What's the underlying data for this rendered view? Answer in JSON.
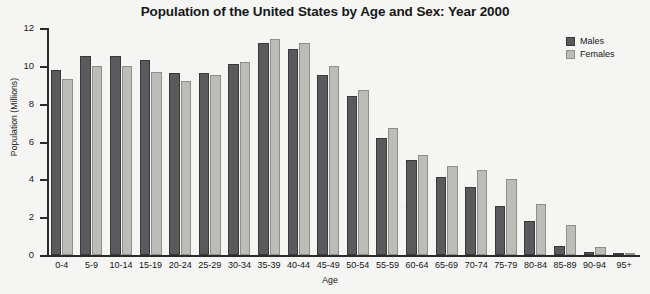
{
  "chart_data": {
    "type": "bar",
    "title": "Population of the United States by Age and Sex: Year 2000",
    "xlabel": "Age",
    "ylabel": "Population (Millions)",
    "ylim": [
      0,
      12
    ],
    "yticks": [
      0,
      2,
      4,
      6,
      8,
      10,
      12
    ],
    "grid": false,
    "legend_position": "top-right",
    "categories": [
      "0-4",
      "5-9",
      "10-14",
      "15-19",
      "20-24",
      "25-29",
      "30-34",
      "35-39",
      "40-44",
      "45-49",
      "50-54",
      "55-59",
      "60-64",
      "65-69",
      "70-74",
      "75-79",
      "80-84",
      "85-89",
      "90-94",
      "95+"
    ],
    "series": [
      {
        "name": "Males",
        "color": "#5a5a5c",
        "values": [
          9.8,
          10.5,
          10.5,
          10.3,
          9.6,
          9.6,
          10.1,
          11.2,
          10.9,
          9.5,
          8.4,
          6.2,
          5.0,
          4.1,
          3.6,
          2.6,
          1.8,
          0.5,
          0.15,
          0.05
        ]
      },
      {
        "name": "Females",
        "color": "#bcbcb8",
        "values": [
          9.3,
          10.0,
          10.0,
          9.7,
          9.2,
          9.5,
          10.2,
          11.4,
          11.2,
          10.0,
          8.7,
          6.7,
          5.3,
          4.7,
          4.5,
          4.0,
          2.7,
          1.6,
          0.4,
          0.12
        ]
      }
    ]
  }
}
